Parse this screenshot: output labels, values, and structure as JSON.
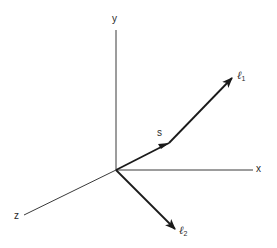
{
  "diagram": {
    "type": "3d-coordinate-vector-diagram",
    "colors": {
      "axis": "#3a3a3a",
      "vector": "#1a1a1a",
      "label": "#2a2a2a",
      "background": "#ffffff"
    },
    "axes": {
      "x": {
        "label": "x"
      },
      "y": {
        "label": "y"
      },
      "z": {
        "label": "z"
      }
    },
    "vectors": {
      "s": {
        "label": "s"
      },
      "l1": {
        "symbol": "ℓ",
        "subscript": "1"
      },
      "l2": {
        "symbol": "ℓ",
        "subscript": "2"
      }
    }
  }
}
